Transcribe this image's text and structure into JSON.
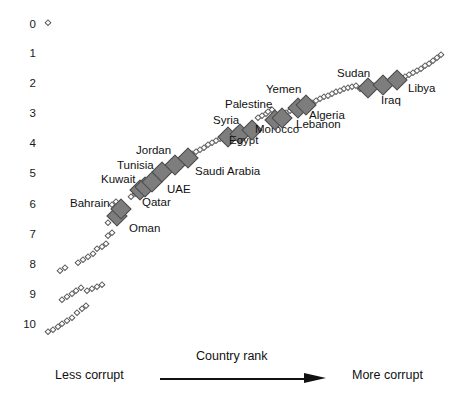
{
  "chart_data": {
    "type": "scatter",
    "title": "",
    "subtitle": "",
    "xlabel": "Country rank",
    "ylabel": "",
    "xlim": [
      0,
      180
    ],
    "ylim": [
      10,
      0
    ],
    "y_inverted": true,
    "grid": false,
    "legend_position": "none",
    "annotations": {
      "x_axis_left": "Less corrupt",
      "x_axis_right": "More corrupt",
      "x_axis_arrow": "left-to-right"
    },
    "ytick_labels": [
      "0",
      "1",
      "2",
      "3",
      "4",
      "5",
      "6",
      "7",
      "8",
      "9",
      "10"
    ],
    "ytick_values": [
      0,
      1,
      2,
      3,
      4,
      5,
      6,
      7,
      8,
      9,
      10
    ],
    "series": [
      {
        "name": "MENA countries (labelled)",
        "marker": "filled-gray-diamond",
        "color": "#7d7d7d",
        "points": [
          {
            "label": "Bahrain",
            "x": 101,
            "y": 6.2,
            "px": 117,
            "py": 216,
            "label_px": 70,
            "label_py": 203,
            "label_anchor": "left"
          },
          {
            "label": "Oman",
            "x": 104,
            "y": 6.05,
            "px": 121,
            "py": 209,
            "label_px": 129,
            "label_py": 228,
            "label_anchor": "left"
          },
          {
            "label": "Kuwait",
            "x": 122,
            "y": 5.45,
            "px": 140,
            "py": 190,
            "label_px": 101,
            "label_py": 179,
            "label_anchor": "left"
          },
          {
            "label": "Qatar",
            "x": 126,
            "y": 5.4,
            "px": 145,
            "py": 187,
            "label_px": 142,
            "label_py": 202,
            "label_anchor": "left"
          },
          {
            "label": "UAE",
            "x": 132,
            "y": 5.25,
            "px": 152,
            "py": 182,
            "label_px": 167,
            "label_py": 189,
            "label_anchor": "left"
          },
          {
            "label": "Tunisia",
            "x": 141,
            "y": 4.95,
            "px": 162,
            "py": 172,
            "label_px": 117,
            "label_py": 165,
            "label_anchor": "left"
          },
          {
            "label": "Jordan",
            "x": 152,
            "y": 4.75,
            "px": 175,
            "py": 165,
            "label_px": 136,
            "label_py": 150,
            "label_anchor": "left"
          },
          {
            "label": "Saudi Arabia",
            "x": 163,
            "y": 4.55,
            "px": 188,
            "py": 158,
            "label_px": 195,
            "label_py": 171,
            "label_anchor": "left"
          },
          {
            "label": "Syria",
            "x": 198,
            "y": 3.9,
            "px": 228,
            "py": 137,
            "label_px": 213,
            "label_py": 120,
            "label_anchor": "left"
          },
          {
            "label": "Egypt",
            "x": 208,
            "y": 3.8,
            "px": 240,
            "py": 134,
            "label_px": 229,
            "label_py": 140,
            "label_anchor": "left"
          },
          {
            "label": "Morocco",
            "x": 219,
            "y": 3.7,
            "px": 252,
            "py": 130,
            "label_px": 255,
            "label_py": 129,
            "label_anchor": "left"
          },
          {
            "label": "Palestine",
            "x": 239,
            "y": 3.4,
            "px": 275,
            "py": 120,
            "label_px": 225,
            "label_py": 104,
            "label_anchor": "left"
          },
          {
            "label": "Lebanon",
            "x": 245,
            "y": 3.35,
            "px": 282,
            "py": 118,
            "label_px": 296,
            "label_py": 124,
            "label_anchor": "left"
          },
          {
            "label": "Yemen",
            "x": 259,
            "y": 3.05,
            "px": 298,
            "py": 108,
            "label_px": 266,
            "label_py": 89,
            "label_anchor": "left"
          },
          {
            "label": "Algeria",
            "x": 266,
            "y": 2.95,
            "px": 306,
            "py": 105,
            "label_px": 309,
            "label_py": 115,
            "label_anchor": "left"
          },
          {
            "label": "Sudan",
            "x": 320,
            "y": 2.45,
            "px": 368,
            "py": 88,
            "label_px": 337,
            "label_py": 73,
            "label_anchor": "left"
          },
          {
            "label": "Iraq",
            "x": 333,
            "y": 2.35,
            "px": 383,
            "py": 85,
            "label_px": 381,
            "label_py": 100,
            "label_anchor": "left"
          },
          {
            "label": "Libya",
            "x": 345,
            "y": 2.2,
            "px": 397,
            "py": 80,
            "label_px": 408,
            "label_py": 88,
            "label_anchor": "left"
          }
        ]
      },
      {
        "name": "Other countries (unlabelled)",
        "marker": "hollow-diamond",
        "color": "#ffffff",
        "points_px": [
          [
            48,
            23
          ],
          [
            48,
            332
          ],
          [
            53,
            330
          ],
          [
            58,
            327
          ],
          [
            62,
            324
          ],
          [
            67,
            321
          ],
          [
            72,
            318
          ],
          [
            77,
            313
          ],
          [
            82,
            309
          ],
          [
            86,
            306
          ],
          [
            62,
            300
          ],
          [
            67,
            297
          ],
          [
            72,
            294
          ],
          [
            76,
            291
          ],
          [
            81,
            288
          ],
          [
            87,
            291
          ],
          [
            92,
            289
          ],
          [
            97,
            287
          ],
          [
            102,
            285
          ],
          [
            60,
            271
          ],
          [
            65,
            268
          ],
          [
            78,
            263
          ],
          [
            83,
            260
          ],
          [
            88,
            257
          ],
          [
            93,
            254
          ],
          [
            97,
            249
          ],
          [
            102,
            247
          ],
          [
            106,
            244
          ],
          [
            108,
            236
          ],
          [
            112,
            233
          ],
          [
            108,
            223
          ],
          [
            112,
            205
          ],
          [
            116,
            202
          ],
          [
            131,
            197
          ],
          [
            135,
            194
          ],
          [
            155,
            180
          ],
          [
            159,
            177
          ],
          [
            168,
            171
          ],
          [
            183,
            163
          ],
          [
            196,
            152
          ],
          [
            200,
            150
          ],
          [
            204,
            148
          ],
          [
            208,
            145
          ],
          [
            212,
            143
          ],
          [
            216,
            141
          ],
          [
            220,
            139
          ],
          [
            188,
            157
          ],
          [
            192,
            154
          ],
          [
            236,
            131
          ],
          [
            258,
            118
          ],
          [
            262,
            116
          ],
          [
            266,
            114
          ],
          [
            268,
            112
          ],
          [
            272,
            110
          ],
          [
            286,
            113
          ],
          [
            290,
            111
          ],
          [
            312,
            103
          ],
          [
            316,
            101
          ],
          [
            320,
            99
          ],
          [
            324,
            97
          ],
          [
            328,
            96
          ],
          [
            332,
            94
          ],
          [
            336,
            92
          ],
          [
            340,
            91
          ],
          [
            344,
            89
          ],
          [
            348,
            88
          ],
          [
            352,
            87
          ],
          [
            356,
            86
          ],
          [
            360,
            89
          ],
          [
            364,
            88
          ],
          [
            374,
            86
          ],
          [
            391,
            82
          ],
          [
            405,
            77
          ],
          [
            409,
            75
          ],
          [
            413,
            73
          ],
          [
            417,
            71
          ],
          [
            421,
            69
          ],
          [
            425,
            66
          ],
          [
            429,
            64
          ],
          [
            433,
            61
          ],
          [
            437,
            58
          ],
          [
            441,
            55
          ]
        ]
      }
    ]
  },
  "y_axis": {
    "ticks": [
      {
        "label": "0",
        "py": 25
      },
      {
        "label": "1",
        "py": 54
      },
      {
        "label": "2",
        "py": 84
      },
      {
        "label": "3",
        "py": 114
      },
      {
        "label": "4",
        "py": 144
      },
      {
        "label": "5",
        "py": 174
      },
      {
        "label": "6",
        "py": 205
      },
      {
        "label": "7",
        "py": 235
      },
      {
        "label": "8",
        "py": 265
      },
      {
        "label": "9",
        "py": 295
      },
      {
        "label": "10",
        "py": 325
      }
    ]
  },
  "x_axis": {
    "rank_title": "Country rank",
    "left_label": "Less corrupt",
    "right_label": "More corrupt"
  }
}
